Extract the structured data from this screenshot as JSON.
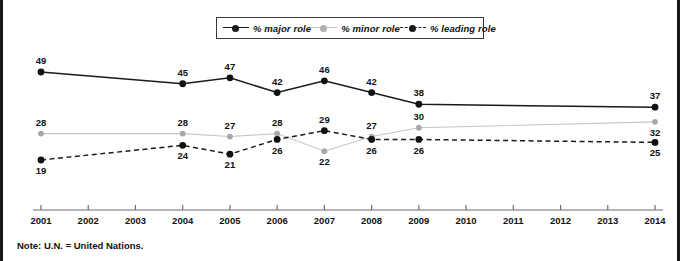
{
  "note": "Note: U.N. = United Nations.",
  "legend": {
    "position": "top-center",
    "items": [
      {
        "label": "% major role",
        "marker": "filled-circle-dark",
        "line": "solid",
        "color": "#1a1a1a"
      },
      {
        "label": "% minor role",
        "marker": "filled-circle-gray",
        "line": "solid",
        "color": "#b0b0b0"
      },
      {
        "label": "% leading role",
        "marker": "filled-circle-dark",
        "line": "dashed",
        "color": "#1a1a1a"
      }
    ]
  },
  "chart_data": {
    "type": "line",
    "title": "",
    "subtitle": "",
    "xlabel": "",
    "ylabel": "",
    "grid": false,
    "legend_position": "top-center",
    "categories": [
      "2001",
      "2002",
      "2003",
      "2004",
      "2005",
      "2006",
      "2007",
      "2008",
      "2009",
      "2010",
      "2011",
      "2012",
      "2013",
      "2014"
    ],
    "x_tick_labels": [
      "2001",
      "2002",
      "2003",
      "2004",
      "2005",
      "2006",
      "2007",
      "2008",
      "2009",
      "2010",
      "2011",
      "2012",
      "2013",
      "2014"
    ],
    "data_years": [
      2001,
      2004,
      2005,
      2006,
      2007,
      2008,
      2009,
      2014
    ],
    "ylim": [
      0,
      55
    ],
    "series": [
      {
        "name": "% major role",
        "style": "solid",
        "color": "#1a1a1a",
        "x": [
          2001,
          2004,
          2005,
          2006,
          2007,
          2008,
          2009,
          2014
        ],
        "values": [
          49,
          45,
          47,
          42,
          46,
          42,
          38,
          37
        ],
        "label_positions": [
          "above",
          "above",
          "above",
          "above",
          "above",
          "above",
          "above",
          "above"
        ]
      },
      {
        "name": "% minor role",
        "style": "solid",
        "color": "#b0b0b0",
        "x": [
          2001,
          2004,
          2005,
          2006,
          2007,
          2008,
          2009,
          2014
        ],
        "values": [
          28,
          28,
          27,
          28,
          22,
          27,
          30,
          32
        ],
        "label_positions": [
          "above",
          "above",
          "above",
          "above",
          "below",
          "above",
          "above",
          "below"
        ]
      },
      {
        "name": "% leading role",
        "style": "dashed",
        "color": "#1a1a1a",
        "x": [
          2001,
          2004,
          2005,
          2006,
          2007,
          2008,
          2009,
          2014
        ],
        "values": [
          19,
          24,
          21,
          26,
          29,
          26,
          26,
          25
        ],
        "label_positions": [
          "below",
          "below",
          "below",
          "below",
          "above",
          "below",
          "below",
          "below"
        ]
      }
    ]
  }
}
